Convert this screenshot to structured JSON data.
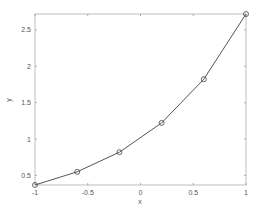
{
  "chart_data": {
    "type": "line",
    "title": "",
    "xlabel": "x",
    "ylabel": "y",
    "xlim": [
      -1,
      1
    ],
    "ylim": [
      0.3679,
      2.7183
    ],
    "grid": false,
    "legend": null,
    "x_ticks": [
      -1,
      -0.5,
      0,
      0.5,
      1
    ],
    "x_tick_labels": [
      "-1",
      "-0.5",
      "0",
      "0.5",
      "1"
    ],
    "y_ticks": [
      0.5,
      1,
      1.5,
      2,
      2.5
    ],
    "y_tick_labels": [
      "0.5",
      "1",
      "1.5",
      "2",
      "2.5"
    ],
    "series": [
      {
        "name": "y",
        "marker": "circle",
        "color": "#555555",
        "x": [
          -1,
          -0.6,
          -0.2,
          0.2,
          0.6,
          1
        ],
        "y": [
          0.368,
          0.549,
          0.819,
          1.221,
          1.822,
          2.718
        ]
      }
    ]
  }
}
